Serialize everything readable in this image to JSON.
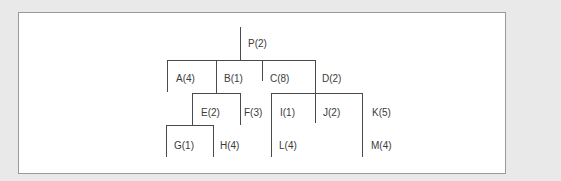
{
  "diagram": {
    "type": "tree",
    "line_color": "#4a4a4a",
    "background": "#ffffff",
    "border_color": "#9a9a9a",
    "nodes": [
      {
        "id": "P",
        "label": "P(2)",
        "parent": null
      },
      {
        "id": "A",
        "label": "A(4)",
        "parent": "P"
      },
      {
        "id": "B",
        "label": "B(1)",
        "parent": "P"
      },
      {
        "id": "C",
        "label": "C(8)",
        "parent": "P"
      },
      {
        "id": "D",
        "label": "D(2)",
        "parent": "P"
      },
      {
        "id": "E",
        "label": "E(2)",
        "parent": "B"
      },
      {
        "id": "F",
        "label": "F(3)",
        "parent": "B"
      },
      {
        "id": "I",
        "label": "I(1)",
        "parent": "D"
      },
      {
        "id": "J",
        "label": "J(2)",
        "parent": "D"
      },
      {
        "id": "K",
        "label": "K(5)",
        "parent": "D"
      },
      {
        "id": "G",
        "label": "G(1)",
        "parent": "E"
      },
      {
        "id": "H",
        "label": "H(4)",
        "parent": "E"
      },
      {
        "id": "L",
        "label": "L(4)",
        "parent": "I"
      },
      {
        "id": "M",
        "label": "M(4)",
        "parent": "K"
      }
    ],
    "labels": {
      "P": "P(2)",
      "A": "A(4)",
      "B": "B(1)",
      "C": "C(8)",
      "D": "D(2)",
      "E": "E(2)",
      "F": "F(3)",
      "I": "I(1)",
      "J": "J(2)",
      "K": "K(5)",
      "G": "G(1)",
      "H": "H(4)",
      "L": "L(4)",
      "M": "M(4)"
    }
  }
}
